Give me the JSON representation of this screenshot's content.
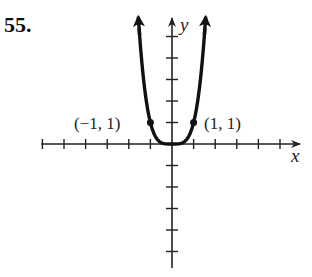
{
  "problem": {
    "number": "55."
  },
  "chart_data": {
    "type": "line",
    "title": "",
    "function": "y = x^4",
    "xlabel": "x",
    "ylabel": "y",
    "xlim": [
      -6,
      6
    ],
    "ylim": [
      -5.5,
      5.8
    ],
    "x_ticks": [
      -6,
      -5,
      -4,
      -3,
      -2,
      -1,
      1,
      2,
      3,
      4,
      5
    ],
    "y_ticks": [
      -5,
      -4,
      -3,
      -2,
      -1,
      1,
      2,
      3,
      4,
      5
    ],
    "grid": false,
    "series": [
      {
        "name": "y = x^4",
        "x": [
          -1.55,
          -1.25,
          -1,
          -0.75,
          -0.5,
          -0.25,
          0,
          0.25,
          0.5,
          0.75,
          1,
          1.25,
          1.55
        ],
        "y": [
          5.77,
          2.44,
          1,
          0.32,
          0.06,
          0.004,
          0,
          0.004,
          0.06,
          0.32,
          1,
          2.44,
          5.77
        ]
      }
    ],
    "annotations": [
      {
        "text": "(−1, 1)",
        "x": -1,
        "y": 1
      },
      {
        "text": "(1, 1)",
        "x": 1,
        "y": 1
      }
    ],
    "origin_px": [
      172,
      144
    ],
    "unit_px": [
      21.6,
      21.5
    ]
  },
  "labels": {
    "point_left": "(−1, 1)",
    "point_right": "(1, 1)",
    "x_axis": "x",
    "y_axis": "y"
  }
}
